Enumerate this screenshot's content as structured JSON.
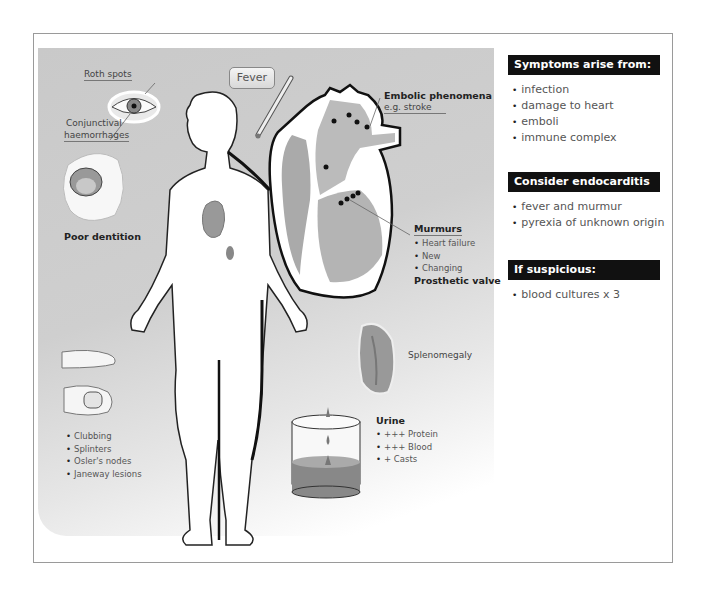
{
  "figure": {
    "labels": {
      "roth_spots": "Roth spots",
      "conjunctival": "Conjunctival",
      "haemorrhages": "haemorrhages",
      "fever": "Fever",
      "poor_dentition": "Poor dentition",
      "embolic_title": "Embolic phenomena",
      "embolic_example": "e.g. stroke",
      "murmurs_title": "Murmurs",
      "prosthetic_valve": "Prosthetic valve",
      "splenomegaly": "Splenomegaly",
      "urine_title": "Urine"
    },
    "murmurs": [
      "Heart failure",
      "New",
      "Changing"
    ],
    "hand_signs": [
      "Clubbing",
      "Splinters",
      "Osler's nodes",
      "Janeway lesions"
    ],
    "urine": [
      "+++ Protein",
      "+++ Blood",
      "+ Casts"
    ]
  },
  "sidebar": {
    "sections": [
      {
        "heading": "Symptoms arise from:",
        "items": [
          "infection",
          "damage to heart",
          "emboli",
          "immune complex"
        ]
      },
      {
        "heading": "Consider endocarditis if:",
        "items": [
          "fever and murmur",
          "pyrexia of unknown origin"
        ]
      },
      {
        "heading": "If suspicious:",
        "items": [
          "blood cultures x 3"
        ]
      }
    ]
  },
  "colors": {
    "header_bg": "#111111",
    "panel_gray": "#cccccc",
    "text_gray": "#555555"
  }
}
